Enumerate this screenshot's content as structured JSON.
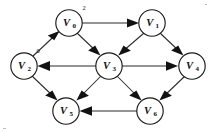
{
  "figure": {
    "kind": "directed-graph",
    "caption": "",
    "background_color": "#ffffff",
    "ink_color": "#121212"
  },
  "nodes": [
    {
      "id": "v0",
      "label": "V",
      "subscript": "0",
      "annotation": "2",
      "cx": 69,
      "cy": 23
    },
    {
      "id": "v1",
      "label": "V",
      "subscript": "1",
      "annotation": "",
      "cx": 152,
      "cy": 23
    },
    {
      "id": "v2",
      "label": "V",
      "subscript": "2",
      "annotation": "0",
      "cx": 24,
      "cy": 66
    },
    {
      "id": "v3",
      "label": "V",
      "subscript": "3",
      "annotation": "",
      "cx": 109,
      "cy": 66
    },
    {
      "id": "v4",
      "label": "V",
      "subscript": "4",
      "annotation": "",
      "cx": 192,
      "cy": 66
    },
    {
      "id": "v5",
      "label": "V",
      "subscript": "5",
      "annotation": "1",
      "cx": 66,
      "cy": 111
    },
    {
      "id": "v6",
      "label": "V",
      "subscript": "6",
      "annotation": "",
      "cx": 150,
      "cy": 111
    }
  ],
  "edges": [
    {
      "id": "e-v0-v1",
      "from": "v0",
      "to": "v1",
      "direction": "right",
      "arrow": "at-target"
    },
    {
      "id": "e-v2-v0",
      "from": "v2",
      "to": "v0",
      "direction": "up-right",
      "arrow": "at-target"
    },
    {
      "id": "e-v0-v3",
      "from": "v0",
      "to": "v3",
      "direction": "down-right",
      "arrow": "at-target"
    },
    {
      "id": "e-v1-v3",
      "from": "v1",
      "to": "v3",
      "direction": "down-left",
      "arrow": "at-target"
    },
    {
      "id": "e-v1-v4",
      "from": "v1",
      "to": "v4",
      "direction": "down-right",
      "arrow": "at-target"
    },
    {
      "id": "e-v3-v2",
      "from": "v3",
      "to": "v2",
      "direction": "left",
      "arrow": "at-target"
    },
    {
      "id": "e-v3-v4",
      "from": "v3",
      "to": "v4",
      "direction": "right",
      "arrow": "at-target"
    },
    {
      "id": "e-v2-v5",
      "from": "v2",
      "to": "v5",
      "direction": "down-right",
      "arrow": "at-target"
    },
    {
      "id": "e-v3-v5",
      "from": "v3",
      "to": "v5",
      "direction": "down-left",
      "arrow": "at-target"
    },
    {
      "id": "e-v3-v6",
      "from": "v3",
      "to": "v6",
      "direction": "down-right",
      "arrow": "at-target"
    },
    {
      "id": "e-v4-v6",
      "from": "v4",
      "to": "v6",
      "direction": "down-left",
      "arrow": "at-target"
    },
    {
      "id": "e-v6-v5",
      "from": "v6",
      "to": "v5",
      "direction": "left",
      "arrow": "at-target"
    }
  ],
  "labels": {
    "v0_text": "V",
    "v0_sub": "0",
    "v0_annotation": "2",
    "v1_text": "V",
    "v1_sub": "1",
    "v2_text": "V",
    "v2_sub": "2",
    "v2_annotation": "0",
    "v3_text": "V",
    "v3_sub": "3",
    "v4_text": "V",
    "v4_sub": "4",
    "v5_text": "V",
    "v5_sub": "5",
    "v5_annotation": "1",
    "v6_text": "V",
    "v6_sub": "6"
  }
}
